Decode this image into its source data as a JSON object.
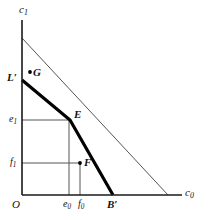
{
  "figure": {
    "type": "economics-intertemporal-budget-diagram",
    "axes": {
      "x_label": "c",
      "x_label_sub": "0",
      "y_label": "c",
      "y_label_sub": "1",
      "origin_label": "O"
    },
    "tick_labels": {
      "y_e1": "e",
      "y_e1_sub": "1",
      "y_f1": "f",
      "y_f1_sub": "1",
      "x_e0": "e",
      "x_e0_sub": "0",
      "x_f0": "f",
      "x_f0_sub": "0"
    },
    "points": [
      {
        "name": "G",
        "label": "G",
        "x": 30,
        "y": 72,
        "dot": true
      },
      {
        "name": "E",
        "label": "E",
        "x": 70,
        "y": 120,
        "dot": false
      },
      {
        "name": "F",
        "label": "F",
        "x": 80,
        "y": 163,
        "dot": true
      }
    ],
    "endpoints": [
      {
        "name": "L-prime",
        "label": "L",
        "prime": "′",
        "x": 22,
        "y": 80
      },
      {
        "name": "B-prime",
        "label": "B",
        "prime": "′",
        "x": 113,
        "y": 195
      }
    ],
    "colors": {
      "axis": "#1a1a1a",
      "thin_line": "#555555",
      "thick_line": "#000000",
      "guide_line": "#444444",
      "background": "#ffffff"
    },
    "geometry": {
      "axis_x": 22,
      "axis_y": 195,
      "y_axis_top": 20,
      "x_axis_right": 182,
      "thin_line": [
        [
          22,
          38
        ],
        [
          168,
          195
        ]
      ],
      "thick_line": [
        [
          22,
          80
        ],
        [
          70,
          120
        ],
        [
          113,
          195
        ]
      ],
      "guide_e1": [
        [
          22,
          120
        ],
        [
          70,
          120
        ]
      ],
      "guide_e0": [
        [
          69,
          120
        ],
        [
          69,
          195
        ]
      ],
      "guide_f1": [
        [
          22,
          163
        ],
        [
          80,
          163
        ]
      ],
      "guide_f0": [
        [
          80,
          163
        ],
        [
          80,
          195
        ]
      ]
    }
  }
}
